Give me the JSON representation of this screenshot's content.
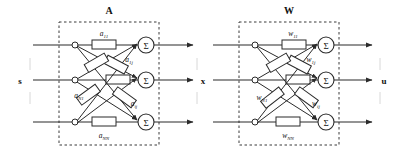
{
  "diagram": {
    "title_a": "A",
    "title_w": "W",
    "input_label": "s",
    "middle_label": "x",
    "output_label": "u",
    "sum_symbol": "Σ",
    "colors": {
      "line": "#2b2b2b",
      "box_fill": "#ffffff",
      "dash": "#3a3a3a",
      "text": "#111111"
    },
    "block_a": {
      "name": "A",
      "weights": [
        {
          "id": "a11",
          "base": "a",
          "sub": "11"
        },
        {
          "id": "a1j",
          "base": "a",
          "sub": "1j"
        },
        {
          "id": "aN1",
          "base": "a",
          "sub": "N1"
        },
        {
          "id": "aij",
          "base": "a",
          "sub": "ij"
        },
        {
          "id": "aNN",
          "base": "a",
          "sub": "NN"
        }
      ]
    },
    "block_w": {
      "name": "W",
      "weights": [
        {
          "id": "w11",
          "base": "w",
          "sub": "11"
        },
        {
          "id": "w1j",
          "base": "w",
          "sub": "1j"
        },
        {
          "id": "wN1",
          "base": "w",
          "sub": "N1"
        },
        {
          "id": "wij",
          "base": "w",
          "sub": "ij"
        },
        {
          "id": "wNN",
          "base": "w",
          "sub": "NN"
        }
      ]
    },
    "rows": [
      {
        "index": 1,
        "y": 45
      },
      {
        "index": 2,
        "y": 80
      },
      {
        "index": 3,
        "y": 122
      }
    ]
  }
}
